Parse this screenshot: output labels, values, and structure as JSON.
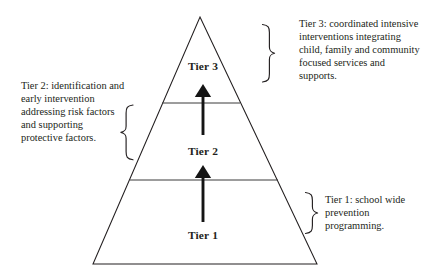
{
  "diagram": {
    "background_color": "#ffffff",
    "line_color": "#231f20",
    "pyramid": {
      "apex": [
        200,
        17
      ],
      "base_left": [
        93,
        264
      ],
      "base_right": [
        317,
        264
      ],
      "dividers": [
        {
          "y": 103,
          "x_start": 162,
          "x_end": 240
        },
        {
          "y": 180,
          "x_start": 130,
          "x_end": 278
        }
      ]
    },
    "tiers": [
      {
        "id": "tier-1",
        "label": "Tier 1"
      },
      {
        "id": "tier-2",
        "label": "Tier 2"
      },
      {
        "id": "tier-3",
        "label": "Tier 3"
      }
    ],
    "arrows": [
      {
        "id": "arrow-tier1-to-tier2",
        "from": [
          203,
          222
        ],
        "to": [
          203,
          166
        ],
        "direction": "up"
      },
      {
        "id": "arrow-tier2-to-tier3",
        "from": [
          203,
          135
        ],
        "to": [
          203,
          85
        ],
        "direction": "up"
      }
    ],
    "callouts": [
      {
        "id": "tier-3",
        "text": "Tier 3: coordinated intensive interventions integrating child, family and community focused services and supports.",
        "brace": "right-curly-brace",
        "side": "right"
      },
      {
        "id": "tier-2",
        "text": "Tier 2: identification and early intervention addressing risk factors and supporting protective factors.",
        "brace": "left-curly-brace",
        "side": "left"
      },
      {
        "id": "tier-1",
        "text": "Tier 1: school wide prevention programming.",
        "brace": "right-curly-brace",
        "side": "right"
      }
    ]
  }
}
